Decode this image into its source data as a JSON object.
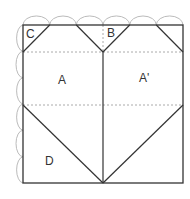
{
  "diagram": {
    "type": "origami-heart-crease-pattern",
    "labels": {
      "C": "C",
      "B": "B",
      "A": "A",
      "A_prime": "A'",
      "D": "D"
    },
    "colors": {
      "line": "#333333",
      "dashed": "#aaaaaa",
      "arc": "#bbbbbb",
      "background": "#ffffff"
    },
    "arcs_top": 6,
    "arcs_left": 6
  }
}
